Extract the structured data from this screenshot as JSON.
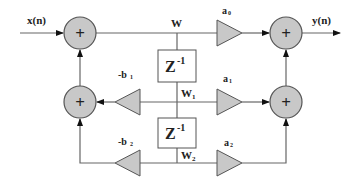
{
  "diagram": {
    "input_label": "x(n)",
    "output_label": "y(n)",
    "state_labels": {
      "w": "W",
      "w1": "W",
      "w1_sub": "1",
      "w2": "W",
      "w2_sub": "2"
    },
    "delay_label": "Z",
    "delay_exp": "-1",
    "adder_symbol": "+",
    "gains": {
      "a0": {
        "base": "a",
        "sub": "0"
      },
      "a1": {
        "base": "a",
        "sub": "1"
      },
      "a2": {
        "base": "a",
        "sub": "2"
      },
      "b1": {
        "base": "-b",
        "sub": "1"
      },
      "b2": {
        "base": "-b",
        "sub": "2"
      }
    },
    "colors": {
      "fill": "#c8c8c8",
      "stroke": "#555555",
      "line": "#666666",
      "text": "#222222"
    }
  }
}
